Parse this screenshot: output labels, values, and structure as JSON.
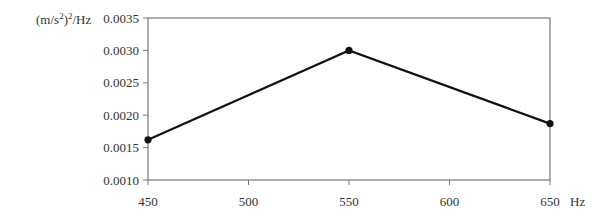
{
  "chart_data": {
    "type": "line",
    "title": "",
    "xlabel": "Hz",
    "ylabel": "(m/s²)²/Hz",
    "x": [
      450,
      550,
      650
    ],
    "series": [
      {
        "name": "PSD",
        "values": [
          0.00162,
          0.003,
          0.00187
        ],
        "color": "#111111",
        "marker": "circle"
      }
    ],
    "xlim": [
      450,
      650
    ],
    "ylim": [
      0.001,
      0.0035
    ],
    "x_ticks": [
      "450",
      "500",
      "550",
      "600",
      "650"
    ],
    "y_ticks": [
      "0.0010",
      "0.0015",
      "0.0020",
      "0.0025",
      "0.0030",
      "0.0035"
    ],
    "grid": false,
    "legend": "none"
  },
  "labels": {
    "y_unit": "(m/s",
    "y_unit_sup1": "2",
    "y_unit_mid": ")",
    "y_unit_sup2": "2",
    "y_unit_tail": "/Hz",
    "x_unit": "Hz"
  }
}
